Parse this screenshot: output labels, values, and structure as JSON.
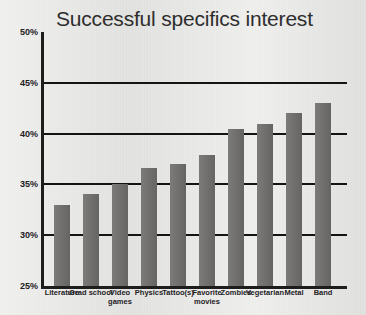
{
  "chart_data": {
    "type": "bar",
    "title": "Successful specifics interest",
    "xlabel": "",
    "ylabel": "",
    "ylim": [
      25,
      50
    ],
    "ytick_labels": [
      "50%",
      "45%",
      "40%",
      "35%",
      "30%",
      "25%"
    ],
    "ytick_values": [
      50,
      45,
      40,
      35,
      30,
      25
    ],
    "grid": true,
    "gridlines_at": [
      45,
      40,
      35,
      30
    ],
    "legend": "none",
    "bar_color": "#6d6c6a",
    "axis_color": "#1d1d1d",
    "background_color": "#e9e9e7",
    "categories": [
      "Literature",
      "Grad school",
      "Video games",
      "Physics",
      "Tattoo(s)",
      "Favorite movies",
      "Zombies",
      "Vegetarian",
      "Metal",
      "Band"
    ],
    "values": [
      33.0,
      34.1,
      35.0,
      36.6,
      37.0,
      37.9,
      40.5,
      40.9,
      42.0,
      43.0
    ]
  }
}
